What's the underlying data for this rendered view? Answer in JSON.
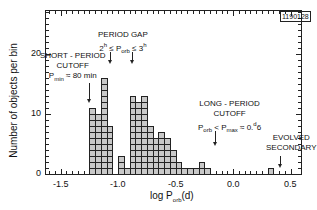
{
  "chart_data": {
    "type": "bar",
    "title": "",
    "xlabel": "log P_orb (d)",
    "ylabel": "Number of objects per bin",
    "xlim": [
      -1.65,
      0.55
    ],
    "ylim": [
      0,
      27
    ],
    "xticks": [
      "-1.5",
      "-1.0",
      "-0.5",
      "0.0",
      "0.5"
    ],
    "yticks": [
      "0",
      "10",
      "20"
    ],
    "bin_width": 0.05,
    "bin_left_edges": [
      -1.25,
      -1.2,
      -1.15,
      -1.1,
      -1.05,
      -1.0,
      -0.95,
      -0.9,
      -0.85,
      -0.8,
      -0.75,
      -0.7,
      -0.65,
      -0.6,
      -0.55,
      -0.5,
      -0.45,
      -0.4,
      -0.35,
      -0.3,
      -0.25,
      -0.2,
      0.3
    ],
    "values": [
      11,
      10,
      16,
      8,
      0,
      3,
      1,
      13,
      12,
      13,
      8,
      6,
      7,
      6,
      4,
      2,
      1,
      1,
      1,
      2,
      1,
      0,
      1
    ],
    "grid": false,
    "annotations": [
      {
        "text": "SHORT-PERIOD CUTOFF",
        "sub": "P_min = 80 min",
        "x": -1.27
      },
      {
        "text": "PERIOD GAP",
        "sub": "2^h ≤ P_orb ≤ 3^h",
        "x": [
          -1.1,
          -0.9
        ]
      },
      {
        "text": "LONG-PERIOD CUTOFF",
        "sub": "P_orb < P_max = 0.6 d",
        "x": -0.22
      },
      {
        "text": "EVOLVED SECONDARY",
        "x": 0.33
      }
    ],
    "figure_id": "1190128"
  },
  "labels": {
    "ylabel": "Number of objects per bin",
    "xlabel_main": "log P",
    "xlabel_sub": "orb",
    "xlabel_tail": "(d)",
    "figure_id": "1190128",
    "ann_short_1": "SHORT - PERIOD",
    "ann_short_2": "CUTOFF",
    "ann_short_3a": "P",
    "ann_short_3b": "min",
    "ann_short_3c": " ≈ 80 min",
    "ann_gap_1": "PERIOD GAP",
    "ann_gap_2a": "2",
    "ann_gap_2b": "h",
    "ann_gap_2c": " ≤ P",
    "ann_gap_2d": "orb",
    "ann_gap_2e": " ≤ 3",
    "ann_gap_2f": "h",
    "ann_long_1": "LONG - PERIOD",
    "ann_long_2": "CUTOFF",
    "ann_long_3a": "P",
    "ann_long_3b": "orb",
    "ann_long_3c": " < P",
    "ann_long_3d": "max",
    "ann_long_3e": " ≈ 0.",
    "ann_long_3f": "d",
    "ann_long_3g": "6",
    "ann_evolved_1": "EVOLVED",
    "ann_evolved_2": "SECONDARY",
    "xt0": "-1.5",
    "xt1": "-1.0",
    "xt2": "-0.5",
    "xt3": "0.0",
    "xt4": "0.5",
    "yt0": "0",
    "yt1": "10",
    "yt2": "20"
  }
}
